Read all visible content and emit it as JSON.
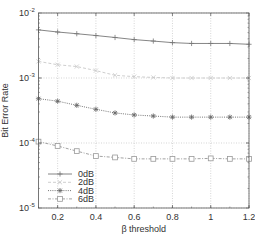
{
  "chart_data": {
    "type": "line",
    "title": "",
    "xlabel": "β threshold",
    "ylabel": "Bit Error Rate",
    "xlim": [
      0.1,
      1.2
    ],
    "ylim": [
      1e-05,
      0.01
    ],
    "yscale": "log",
    "grid": true,
    "legend_position": "lower left",
    "x_ticks": [
      0.2,
      0.4,
      0.6,
      0.8,
      1,
      1.2
    ],
    "x_tick_labels": [
      "0.2",
      "0.4",
      "0.6",
      "0.8",
      "1",
      "1.2"
    ],
    "y_ticks": [
      1e-05,
      0.0001,
      0.001,
      0.01
    ],
    "y_tick_labels": [
      {
        "base": "10",
        "exp": "-5"
      },
      {
        "base": "10",
        "exp": "-4"
      },
      {
        "base": "10",
        "exp": "-3"
      },
      {
        "base": "10",
        "exp": "-2"
      }
    ],
    "x": [
      0.1,
      0.2,
      0.3,
      0.4,
      0.5,
      0.6,
      0.7,
      0.8,
      0.9,
      1.0,
      1.1,
      1.2
    ],
    "series": [
      {
        "name": "0dB",
        "marker": "plus",
        "line": "solid",
        "color": "#777777",
        "values": [
          0.0055,
          0.0051,
          0.0048,
          0.0045,
          0.0042,
          0.0039,
          0.0037,
          0.0035,
          0.0034,
          0.0034,
          0.0034,
          0.0033
        ]
      },
      {
        "name": "2dB",
        "marker": "cross",
        "line": "dashed",
        "color": "#c8c8c8",
        "values": [
          0.0018,
          0.0016,
          0.0015,
          0.0013,
          0.0011,
          0.00105,
          0.00102,
          0.001,
          0.001,
          0.001,
          0.001,
          0.001
        ]
      },
      {
        "name": "4dB",
        "marker": "asterisk",
        "line": "dotted",
        "color": "#666666",
        "values": [
          0.00048,
          0.00044,
          0.00038,
          0.00033,
          0.00029,
          0.00027,
          0.00026,
          0.00025,
          0.00025,
          0.00025,
          0.00025,
          0.00025
        ]
      },
      {
        "name": "6dB",
        "marker": "square",
        "line": "dashdot",
        "color": "#999999",
        "values": [
          0.000105,
          9e-05,
          7.5e-05,
          6.3e-05,
          6e-05,
          5.7e-05,
          5.7e-05,
          5.7e-05,
          5.7e-05,
          5.8e-05,
          5.7e-05,
          5.7e-05
        ]
      }
    ]
  },
  "legend": {
    "items": [
      {
        "label": "0dB"
      },
      {
        "label": "2dB"
      },
      {
        "label": "4dB"
      },
      {
        "label": "6dB"
      }
    ]
  },
  "axes": {
    "xlabel": "β threshold",
    "ylabel": "Bit Error Rate"
  }
}
